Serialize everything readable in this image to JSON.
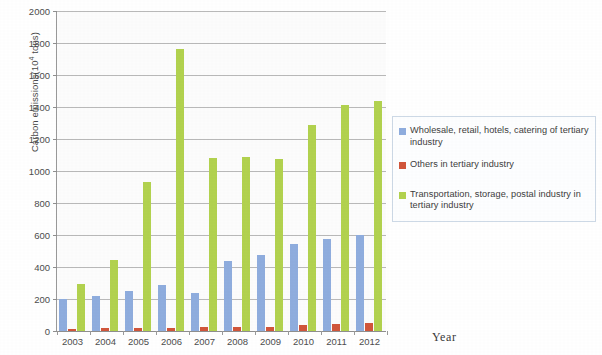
{
  "chart_data": {
    "type": "bar",
    "title": "",
    "xlabel": "Year",
    "ylabel": "Carbon emissions(10⁴ tons)",
    "ylabel_prefix": "Carbon emissions(10",
    "ylabel_exponent": "4",
    "ylabel_suffix": " tons)",
    "categories": [
      "2003",
      "2004",
      "2005",
      "2006",
      "2007",
      "2008",
      "2009",
      "2010",
      "2011",
      "2012"
    ],
    "ylim": [
      0,
      2000
    ],
    "yticks": [
      0,
      200,
      400,
      600,
      800,
      1000,
      1200,
      1400,
      1600,
      1800,
      2000
    ],
    "ytick_labels": [
      "0",
      "200",
      "400",
      "600",
      "800",
      "1000",
      "1200",
      "1400",
      "1600",
      "1800",
      "2000"
    ],
    "grid": true,
    "legend_position": "right",
    "series": [
      {
        "name": "Wholesale, retail, hotels, catering of tertiary industry",
        "color": "#8fadde",
        "values": [
          200,
          220,
          250,
          290,
          240,
          440,
          475,
          545,
          575,
          600
        ]
      },
      {
        "name": "Others in tertiary industry",
        "color": "#d1563b",
        "values": [
          15,
          18,
          16,
          20,
          22,
          25,
          28,
          38,
          45,
          48
        ]
      },
      {
        "name": "Transportation, storage, postal industry in tertiary industry",
        "color": "#b2d24f",
        "values": [
          295,
          445,
          930,
          1765,
          1080,
          1085,
          1075,
          1285,
          1415,
          1435
        ]
      }
    ]
  },
  "legend": {
    "items": [
      {
        "label": "Wholesale, retail, hotels, catering of tertiary industry",
        "color": "#8fadde"
      },
      {
        "label": "Others in tertiary industry",
        "color": "#d1563b"
      },
      {
        "label": "Transportation, storage, postal industry in tertiary industry",
        "color": "#b2d24f"
      }
    ]
  }
}
